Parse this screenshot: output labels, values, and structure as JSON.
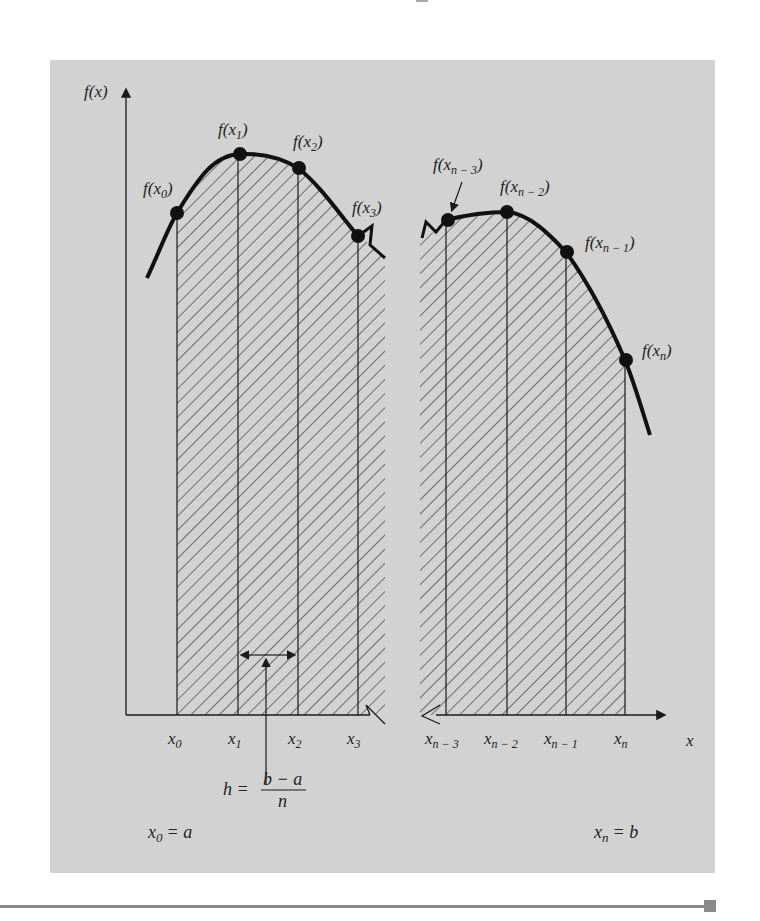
{
  "figure": {
    "colors": {
      "panel": "#d2d2d2",
      "ink": "#1a1a1a",
      "hatch": "#333333"
    },
    "axes": {
      "y_label": "f(x)",
      "x_label": "x"
    },
    "points_left": [
      {
        "label_base": "f(x",
        "sub": "0",
        "label_end": ")",
        "x_label": "x",
        "x_sub": "0"
      },
      {
        "label_base": "f(x",
        "sub": "1",
        "label_end": ")",
        "x_label": "x",
        "x_sub": "1"
      },
      {
        "label_base": "f(x",
        "sub": "2",
        "label_end": ")",
        "x_label": "x",
        "x_sub": "2"
      },
      {
        "label_base": "f(x",
        "sub": "3",
        "label_end": ")",
        "x_label": "x",
        "x_sub": "3"
      }
    ],
    "points_right": [
      {
        "label_base": "f(x",
        "sub": "n − 3",
        "label_end": ")",
        "x_label": "x",
        "x_sub": "n − 3"
      },
      {
        "label_base": "f(x",
        "sub": "n − 2",
        "label_end": ")",
        "x_label": "x",
        "x_sub": "n − 2"
      },
      {
        "label_base": "f(x",
        "sub": "n − 1",
        "label_end": ")",
        "x_label": "x",
        "x_sub": "n − 1"
      },
      {
        "label_base": "f(x",
        "sub": "n",
        "label_end": ")",
        "x_label": "x",
        "x_sub": "n"
      }
    ],
    "width_formula": {
      "lhs": "h =",
      "numerator": "b − a",
      "denominator": "n"
    },
    "start_eq": {
      "var": "x",
      "sub": "0",
      "rhs": "= a"
    },
    "end_eq": {
      "var": "x",
      "sub": "n",
      "rhs": "= b"
    }
  }
}
